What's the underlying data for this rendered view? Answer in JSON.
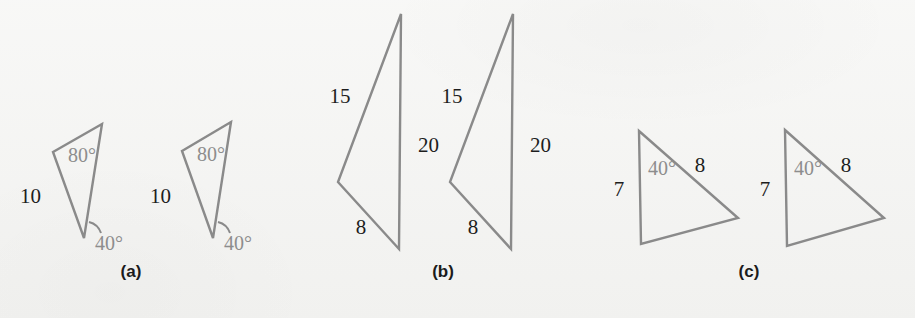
{
  "figure": {
    "background_color": "#f4f4f2",
    "stroke_color": "#8a8a8a",
    "side_label_color": "#1d1d1d",
    "angle_label_color": "#8d8d8d"
  },
  "panels": [
    {
      "id": "a",
      "label": "(a)",
      "label_x": 131,
      "label_y": 272,
      "shapes": [
        {
          "name": "triangle-a-left",
          "points": "102,124 53,152 84,238",
          "labels": [
            {
              "name": "angle-80-left",
              "text": "80°",
              "kind": "angle",
              "x": 68,
              "y": 162,
              "anchor": "start"
            },
            {
              "name": "side-10-left",
              "text": "10",
              "kind": "side",
              "x": 20,
              "y": 203,
              "anchor": "start"
            },
            {
              "name": "angle-40-left",
              "text": "40°",
              "kind": "angle",
              "x": 95,
              "y": 250,
              "anchor": "start"
            }
          ],
          "arc": {
            "name": "angle-arc-40-left",
            "d": "M 89,222 A 17,17 0 0 1 101,233"
          }
        },
        {
          "name": "triangle-a-right",
          "points": "231,122 182,151 213,238",
          "labels": [
            {
              "name": "angle-80-right",
              "text": "80°",
              "kind": "angle",
              "x": 197,
              "y": 161,
              "anchor": "start"
            },
            {
              "name": "side-10-right",
              "text": "10",
              "kind": "side",
              "x": 150,
              "y": 203,
              "anchor": "start"
            },
            {
              "name": "angle-40-right",
              "text": "40°",
              "kind": "angle",
              "x": 224,
              "y": 250,
              "anchor": "start"
            }
          ],
          "arc": {
            "name": "angle-arc-40-right",
            "d": "M 218,222 A 17,17 0 0 1 230,233"
          }
        }
      ]
    },
    {
      "id": "b",
      "label": "(b)",
      "label_x": 443,
      "label_y": 272,
      "shapes": [
        {
          "name": "triangle-b-left",
          "points": "401,14 338,182 399,249",
          "labels": [
            {
              "name": "side-15-left",
              "text": "15",
              "kind": "side",
              "x": 340,
              "y": 103,
              "anchor": "middle"
            },
            {
              "name": "side-20-left",
              "text": "20",
              "kind": "side",
              "x": 418,
              "y": 152,
              "anchor": "start"
            },
            {
              "name": "side-8-left",
              "text": "8",
              "kind": "side",
              "x": 361,
              "y": 234,
              "anchor": "middle"
            }
          ],
          "arc": null
        },
        {
          "name": "triangle-b-right",
          "points": "513,14 450,182 511,249",
          "labels": [
            {
              "name": "side-15-right",
              "text": "15",
              "kind": "side",
              "x": 452,
              "y": 103,
              "anchor": "middle"
            },
            {
              "name": "side-20-right",
              "text": "20",
              "kind": "side",
              "x": 530,
              "y": 152,
              "anchor": "start"
            },
            {
              "name": "side-8-right",
              "text": "8",
              "kind": "side",
              "x": 473,
              "y": 234,
              "anchor": "middle"
            }
          ],
          "arc": null
        }
      ]
    },
    {
      "id": "c",
      "label": "(c)",
      "label_x": 749,
      "label_y": 272,
      "shapes": [
        {
          "name": "triangle-c-left",
          "points": "639,131 738,218 641,244",
          "labels": [
            {
              "name": "angle-40-c-left",
              "text": "40°",
              "kind": "angle",
              "x": 648,
              "y": 175,
              "anchor": "start"
            },
            {
              "name": "side-8-c-left",
              "text": "8",
              "kind": "side",
              "x": 700,
              "y": 172,
              "anchor": "middle"
            },
            {
              "name": "side-7-c-left",
              "text": "7",
              "kind": "side",
              "x": 619,
              "y": 196,
              "anchor": "middle"
            }
          ],
          "arc": null
        },
        {
          "name": "triangle-c-right",
          "points": "785,130 884,218 787,246",
          "labels": [
            {
              "name": "angle-40-c-right",
              "text": "40°",
              "kind": "angle",
              "x": 794,
              "y": 175,
              "anchor": "start"
            },
            {
              "name": "side-8-c-right",
              "text": "8",
              "kind": "side",
              "x": 846,
              "y": 172,
              "anchor": "middle"
            },
            {
              "name": "side-7-c-right",
              "text": "7",
              "kind": "side",
              "x": 765,
              "y": 196,
              "anchor": "middle"
            }
          ],
          "arc": null
        }
      ]
    }
  ]
}
